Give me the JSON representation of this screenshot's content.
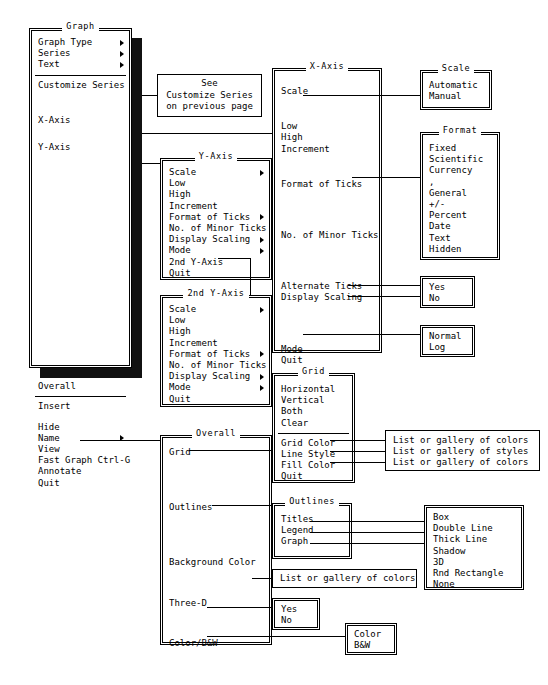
{
  "diagram": {
    "note_box": {
      "lines": [
        "See",
        "Customize Series",
        "on previous page"
      ]
    }
  },
  "menus": {
    "graph": {
      "title": "Graph",
      "items": [
        {
          "label": "Graph Type",
          "arrow": true
        },
        {
          "label": "Series",
          "arrow": true
        },
        {
          "label": "Text",
          "arrow": true
        },
        {
          "label": "Customize Series",
          "arrow": false
        },
        {
          "label": "X-Axis",
          "arrow": false
        },
        {
          "label": "Y-Axis",
          "arrow": false
        },
        {
          "label": "Overall",
          "arrow": false
        },
        {
          "label": "Insert",
          "arrow": false
        },
        {
          "label": "Hide",
          "arrow": false
        },
        {
          "label": "Name",
          "arrow": true
        },
        {
          "label": "View",
          "arrow": false
        },
        {
          "label": "Fast Graph Ctrl-G",
          "arrow": false
        },
        {
          "label": "Annotate",
          "arrow": false
        },
        {
          "label": "Quit",
          "arrow": false
        }
      ]
    },
    "x_axis": {
      "title": "X-Axis",
      "items": [
        {
          "label": "Scale"
        },
        {
          "label": "Low"
        },
        {
          "label": "High"
        },
        {
          "label": "Increment"
        },
        {
          "label": "Format of Ticks"
        },
        {
          "label": "No. of Minor Ticks"
        },
        {
          "label": "Alternate Ticks"
        },
        {
          "label": "Display Scaling"
        },
        {
          "label": "Mode"
        },
        {
          "label": "Quit"
        }
      ]
    },
    "y_axis": {
      "title": "Y-Axis",
      "items": [
        {
          "label": "Scale",
          "arrow": true
        },
        {
          "label": "Low",
          "arrow": false
        },
        {
          "label": "High",
          "arrow": false
        },
        {
          "label": "Increment",
          "arrow": false
        },
        {
          "label": "Format of Ticks",
          "arrow": true
        },
        {
          "label": "No. of Minor Ticks",
          "arrow": false
        },
        {
          "label": "Display Scaling",
          "arrow": true
        },
        {
          "label": "Mode",
          "arrow": true
        },
        {
          "label": "2nd Y-Axis",
          "arrow": false
        },
        {
          "label": "Quit",
          "arrow": false
        }
      ]
    },
    "y_axis_2nd": {
      "title": "2nd Y-Axis",
      "items": [
        {
          "label": "Scale",
          "arrow": true
        },
        {
          "label": "Low",
          "arrow": false
        },
        {
          "label": "High",
          "arrow": false
        },
        {
          "label": "Increment",
          "arrow": false
        },
        {
          "label": "Format of Ticks",
          "arrow": true
        },
        {
          "label": "No. of Minor Ticks",
          "arrow": false
        },
        {
          "label": "Display Scaling",
          "arrow": true
        },
        {
          "label": "Mode",
          "arrow": true
        },
        {
          "label": "Quit",
          "arrow": false
        }
      ]
    },
    "grid": {
      "title": "Grid",
      "items": [
        {
          "label": "Horizontal"
        },
        {
          "label": "Vertical"
        },
        {
          "label": "Both"
        },
        {
          "label": "Clear"
        },
        {
          "label": "Grid Color"
        },
        {
          "label": "Line Style"
        },
        {
          "label": "Fill Color"
        },
        {
          "label": "Quit"
        }
      ]
    },
    "overall": {
      "title": "Overall",
      "items": [
        {
          "label": "Grid"
        },
        {
          "label": "Outlines"
        },
        {
          "label": "Background Color"
        },
        {
          "label": "Three-D"
        },
        {
          "label": "Color/B&W"
        }
      ]
    },
    "outlines": {
      "title": "Outlines",
      "items": [
        {
          "label": "Titles"
        },
        {
          "label": "Legend"
        },
        {
          "label": "Graph"
        }
      ]
    },
    "scale": {
      "title": "Scale",
      "items": [
        {
          "label": "Automatic"
        },
        {
          "label": "Manual"
        }
      ]
    },
    "format": {
      "title": "Format",
      "items": [
        {
          "label": "Fixed"
        },
        {
          "label": "Scientific"
        },
        {
          "label": "Currency"
        },
        {
          "label": ","
        },
        {
          "label": "General"
        },
        {
          "label": "+/-"
        },
        {
          "label": "Percent"
        },
        {
          "label": "Date"
        },
        {
          "label": "Text"
        },
        {
          "label": "Hidden"
        }
      ]
    },
    "yes_no_ticks": {
      "items": [
        {
          "label": "Yes"
        },
        {
          "label": "No"
        }
      ]
    },
    "mode": {
      "items": [
        {
          "label": "Normal"
        },
        {
          "label": "Log"
        }
      ]
    },
    "grid_targets": {
      "items": [
        {
          "label": "List or gallery of colors"
        },
        {
          "label": "List or gallery of styles"
        },
        {
          "label": "List or gallery of colors"
        }
      ]
    },
    "outline_styles": {
      "items": [
        {
          "label": "Box"
        },
        {
          "label": "Double Line"
        },
        {
          "label": "Thick Line"
        },
        {
          "label": "Shadow"
        },
        {
          "label": "3D"
        },
        {
          "label": "Rnd Rectangle"
        },
        {
          "label": "None"
        }
      ]
    },
    "background_color": {
      "items": [
        {
          "label": "List or gallery of colors"
        }
      ]
    },
    "three_d": {
      "items": [
        {
          "label": "Yes"
        },
        {
          "label": "No"
        }
      ]
    },
    "color_bw": {
      "items": [
        {
          "label": "Color"
        },
        {
          "label": "B&W"
        }
      ]
    }
  }
}
